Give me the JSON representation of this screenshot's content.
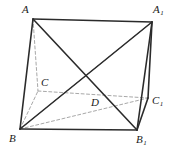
{
  "figure": {
    "kind": "geometry-diagram",
    "width": 175,
    "height": 153,
    "background_color": "#ffffff",
    "solid_edge_color": "#2b2b2b",
    "hidden_edge_color": "#a8a8a8",
    "label_color": "#1a1a1a",
    "solid_stroke_width": 1.6,
    "hidden_stroke_width": 1.0,
    "hidden_dash_pattern": "3,2.4"
  },
  "points": {
    "A": {
      "label": "A",
      "sub": "",
      "x": 33,
      "y": 19,
      "label_x": 22,
      "label_y": 4
    },
    "A1": {
      "label": "A",
      "sub": "1",
      "x": 152,
      "y": 22,
      "label_x": 153,
      "label_y": 4
    },
    "B": {
      "label": "B",
      "sub": "",
      "x": 20,
      "y": 129,
      "label_x": 9,
      "label_y": 133
    },
    "B1": {
      "label": "B",
      "sub": "1",
      "x": 137,
      "y": 130,
      "label_x": 136,
      "label_y": 134
    },
    "C": {
      "label": "C",
      "sub": "",
      "x": 38,
      "y": 91,
      "label_x": 41,
      "label_y": 77
    },
    "C1": {
      "label": "C",
      "sub": "1",
      "x": 148,
      "y": 98,
      "label_x": 152,
      "label_y": 95
    },
    "D": {
      "label": "D",
      "sub": "",
      "x": 93,
      "y": 95,
      "label_x": 91,
      "label_y": 97
    }
  },
  "edges": {
    "solid": [
      {
        "name": "edge-A-A1",
        "from": "A",
        "to": "A1"
      },
      {
        "name": "edge-A-B",
        "from": "A",
        "to": "B"
      },
      {
        "name": "edge-B-B1",
        "from": "B",
        "to": "B1"
      },
      {
        "name": "edge-A1-B1",
        "from": "A1",
        "to": "B1"
      },
      {
        "name": "edge-A1-C1",
        "from": "A1",
        "to": "C1"
      },
      {
        "name": "edge-B1-C1",
        "from": "B1",
        "to": "C1"
      },
      {
        "name": "diagonal-A-B1",
        "from": "A",
        "to": "B1"
      },
      {
        "name": "diagonal-B-A1",
        "from": "B",
        "to": "A1"
      }
    ],
    "hidden": [
      {
        "name": "edge-A-C",
        "from": "A",
        "to": "C"
      },
      {
        "name": "edge-B-C",
        "from": "B",
        "to": "C"
      },
      {
        "name": "edge-C-C1",
        "from": "C",
        "to": "C1"
      },
      {
        "name": "edge-B-C1",
        "from": "B",
        "to": "C1"
      },
      {
        "name": "diagonal-B-A1-hidden",
        "from": "B",
        "to": "A1"
      }
    ]
  }
}
